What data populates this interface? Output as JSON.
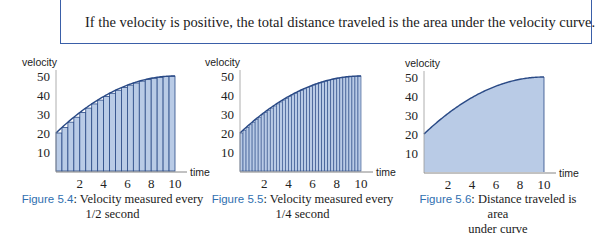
{
  "callout": {
    "text": "If the velocity is positive, the total distance traveled is the area under the velocity curve."
  },
  "colors": {
    "callout_border": "#3a5fa8",
    "fill": "#b9cbe6",
    "curve": "#2a4a86",
    "bar_edge": "#2a4a86",
    "figure_label": "#2f6fb0"
  },
  "figures": [
    {
      "label": "Figure 5.4",
      "caption_line1": ": Velocity measured every",
      "caption_line2": "1/2 second",
      "y_axis_label": "velocity",
      "x_axis_label": "time"
    },
    {
      "label": "Figure 5.5",
      "caption_line1": ": Velocity measured every",
      "caption_line2": "1/4 second",
      "y_axis_label": "velocity",
      "x_axis_label": "time"
    },
    {
      "label": "Figure 5.6",
      "caption_line1": ": Distance traveled is area",
      "caption_line2": "under curve",
      "y_axis_label": "velocity",
      "x_axis_label": "time"
    }
  ],
  "chart_data": [
    {
      "type": "bar",
      "title": "Velocity measured every 1/2 second",
      "xlabel": "time",
      "ylabel": "velocity",
      "x_ticks": [
        2,
        4,
        6,
        8,
        10
      ],
      "y_ticks": [
        10,
        20,
        30,
        40,
        50
      ],
      "xlim": [
        0,
        10
      ],
      "ylim": [
        0,
        50
      ],
      "bar_width": 0.5,
      "curve": "v(t) = 20 + 6t - 0.3t^2",
      "categories": [
        0,
        0.5,
        1,
        1.5,
        2,
        2.5,
        3,
        3.5,
        4,
        4.5,
        5,
        5.5,
        6,
        6.5,
        7,
        7.5,
        8,
        8.5,
        9,
        9.5
      ],
      "values": [
        20,
        22.9,
        25.7,
        28.3,
        30.8,
        33.1,
        35.3,
        37.3,
        39.2,
        40.9,
        42.5,
        43.9,
        45.2,
        46.3,
        47.3,
        48.1,
        48.8,
        49.3,
        49.7,
        49.9
      ],
      "grid": false
    },
    {
      "type": "bar",
      "title": "Velocity measured every 1/4 second",
      "xlabel": "time",
      "ylabel": "velocity",
      "x_ticks": [
        2,
        4,
        6,
        8,
        10
      ],
      "y_ticks": [
        10,
        20,
        30,
        40,
        50
      ],
      "xlim": [
        0,
        10
      ],
      "ylim": [
        0,
        50
      ],
      "bar_width": 0.25,
      "bar_count": 40,
      "curve": "v(t) = 20 + 6t - 0.3t^2",
      "grid": false
    },
    {
      "type": "area",
      "title": "Distance traveled is area under curve",
      "xlabel": "time",
      "ylabel": "velocity",
      "x_ticks": [
        2,
        4,
        6,
        8,
        10
      ],
      "y_ticks": [
        10,
        20,
        30,
        40,
        50
      ],
      "xlim": [
        0,
        10
      ],
      "ylim": [
        0,
        50
      ],
      "x": [
        0,
        1,
        2,
        3,
        4,
        5,
        6,
        7,
        8,
        9,
        10
      ],
      "values": [
        20,
        25.7,
        30.8,
        35.3,
        39.2,
        42.5,
        45.2,
        47.3,
        48.8,
        49.7,
        50
      ],
      "grid": false
    }
  ]
}
